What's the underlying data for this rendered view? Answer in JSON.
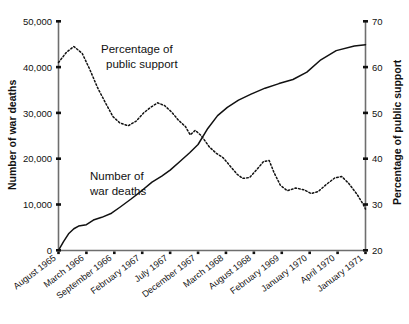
{
  "chart_data": {
    "type": "line",
    "title": "",
    "xlabel": "",
    "categories": [
      "August 1965",
      "March 1966",
      "September 1966",
      "February 1967",
      "July 1967",
      "December 1967",
      "March 1968",
      "August 1968",
      "February 1969",
      "January 1970",
      "April 1970",
      "January 1971"
    ],
    "grid": false,
    "legend_position": "inline-annotations",
    "axes": {
      "left": {
        "label": "Number of war deaths",
        "ticks": [
          "0",
          "10,000",
          "20,000",
          "30,000",
          "40,000",
          "50,000"
        ],
        "tick_values": [
          0,
          10000,
          20000,
          30000,
          40000,
          50000
        ],
        "ylim": [
          0,
          50000
        ]
      },
      "right": {
        "label": "Percentage of public support",
        "ticks": [
          "20",
          "30",
          "40",
          "50",
          "60",
          "70"
        ],
        "tick_values": [
          20,
          30,
          40,
          50,
          60,
          70
        ],
        "ylim": [
          20,
          70
        ]
      }
    },
    "series": [
      {
        "name": "Number of war deaths",
        "axis": "left",
        "style": "solid",
        "annotation": "Number of\nwar deaths",
        "annotation_line_1": "Number of",
        "annotation_line_2": "war deaths",
        "values": [
          0,
          2900,
          5200,
          7000,
          10200,
          14500,
          20500,
          28500,
          35500,
          40800,
          43000,
          44800
        ]
      },
      {
        "name": "Percentage of public support",
        "axis": "right",
        "style": "dotted",
        "annotation": "Percentage of\npublic support",
        "annotation_line_1": "Percentage of",
        "annotation_line_2": "public support",
        "values": [
          61,
          64,
          52,
          48,
          50,
          52,
          41,
          38,
          39,
          33,
          35,
          29
        ]
      }
    ],
    "detailed_points": {
      "deaths_px": [
        [
          0,
          0
        ],
        [
          0.18,
          1900
        ],
        [
          0.36,
          3600
        ],
        [
          0.55,
          4700
        ],
        [
          0.72,
          5300
        ],
        [
          1.0,
          5600
        ],
        [
          1.25,
          6600
        ],
        [
          1.55,
          7200
        ],
        [
          1.9,
          8100
        ],
        [
          2.2,
          9400
        ],
        [
          2.6,
          11200
        ],
        [
          3.0,
          13100
        ],
        [
          3.35,
          14900
        ],
        [
          3.7,
          16200
        ],
        [
          4.0,
          17500
        ],
        [
          4.35,
          19400
        ],
        [
          4.7,
          21300
        ],
        [
          5.0,
          23100
        ],
        [
          5.35,
          26600
        ],
        [
          5.7,
          29400
        ],
        [
          6.05,
          31200
        ],
        [
          6.45,
          32800
        ],
        [
          6.9,
          34100
        ],
        [
          7.4,
          35400
        ],
        [
          7.9,
          36400
        ],
        [
          8.4,
          37300
        ],
        [
          8.9,
          38900
        ],
        [
          9.4,
          41600
        ],
        [
          9.95,
          43600
        ],
        [
          10.6,
          44600
        ],
        [
          11,
          44900
        ]
      ],
      "support_px": [
        [
          0,
          61.0
        ],
        [
          0.28,
          63.2
        ],
        [
          0.55,
          64.5
        ],
        [
          0.85,
          63.0
        ],
        [
          1.12,
          59.5
        ],
        [
          1.4,
          55.5
        ],
        [
          1.7,
          52.0
        ],
        [
          1.95,
          49.2
        ],
        [
          2.2,
          47.8
        ],
        [
          2.5,
          47.2
        ],
        [
          2.78,
          48.2
        ],
        [
          3.05,
          50.0
        ],
        [
          3.3,
          51.2
        ],
        [
          3.55,
          52.2
        ],
        [
          3.8,
          51.6
        ],
        [
          4.05,
          50.2
        ],
        [
          4.3,
          48.4
        ],
        [
          4.55,
          47.0
        ],
        [
          4.72,
          45.2
        ],
        [
          4.9,
          46.2
        ],
        [
          5.12,
          45.0
        ],
        [
          5.4,
          42.6
        ],
        [
          5.65,
          41.2
        ],
        [
          5.9,
          40.2
        ],
        [
          6.15,
          38.4
        ],
        [
          6.4,
          36.6
        ],
        [
          6.6,
          35.7
        ],
        [
          6.85,
          35.9
        ],
        [
          7.1,
          37.6
        ],
        [
          7.35,
          39.4
        ],
        [
          7.55,
          39.6
        ],
        [
          7.72,
          37.0
        ],
        [
          7.95,
          34.2
        ],
        [
          8.2,
          33.0
        ],
        [
          8.5,
          33.6
        ],
        [
          8.8,
          33.2
        ],
        [
          9.05,
          32.4
        ],
        [
          9.3,
          32.8
        ],
        [
          9.6,
          34.4
        ],
        [
          9.9,
          35.8
        ],
        [
          10.15,
          36.1
        ],
        [
          10.4,
          34.6
        ],
        [
          10.7,
          32.2
        ],
        [
          10.92,
          30.0
        ],
        [
          11,
          29.0
        ]
      ]
    }
  }
}
